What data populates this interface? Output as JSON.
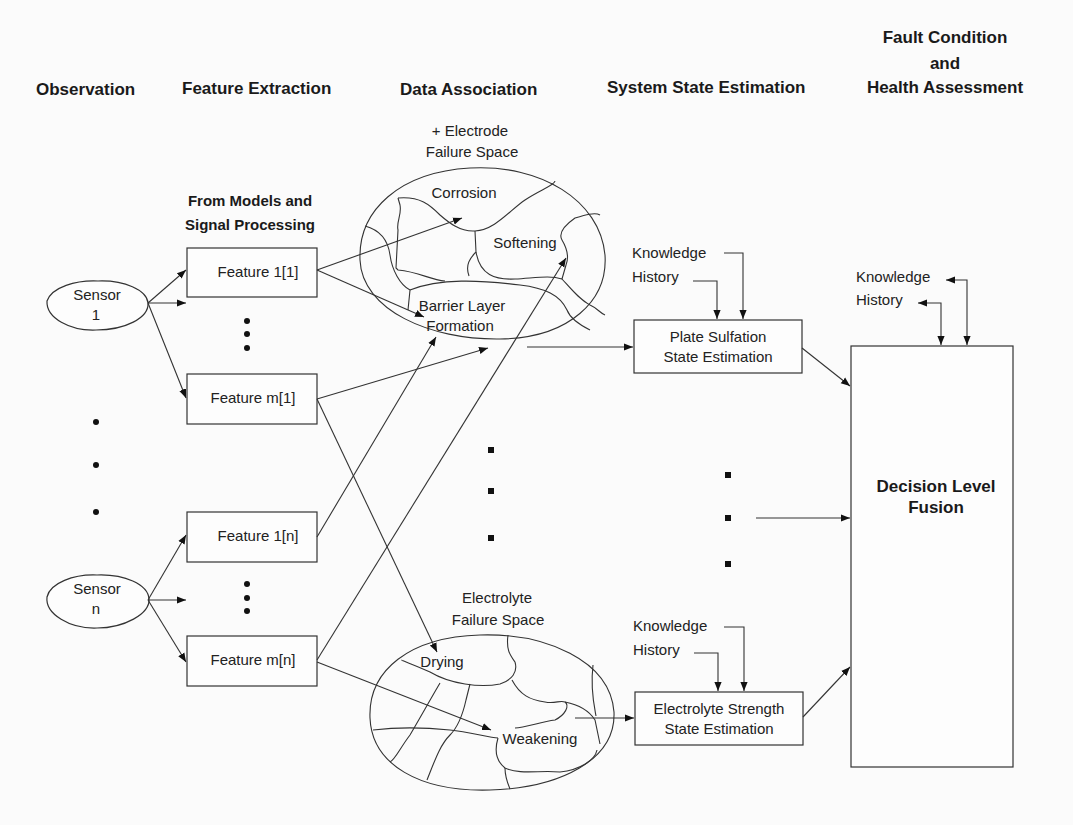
{
  "stages": {
    "observation": "Observation",
    "feature_extraction": "Feature Extraction",
    "data_association": "Data Association",
    "system_state_estimation": "System State Estimation",
    "fault_condition_line1": "Fault Condition",
    "fault_condition_line2": "and",
    "fault_condition_line3": "Health Assessment"
  },
  "feature_source": {
    "line1": "From Models and",
    "line2": "Signal Processing"
  },
  "sensors": [
    {
      "line1": "Sensor",
      "line2": "1"
    },
    {
      "line1": "Sensor",
      "line2": "n"
    }
  ],
  "features": [
    "Feature 1[1]",
    "Feature m[1]",
    "Feature 1[n]",
    "Feature m[n]"
  ],
  "electrode_space": {
    "title_line1": "+ Electrode",
    "title_line2": "Failure Space",
    "regions": [
      "Corrosion",
      "Softening",
      "Barrier Layer",
      "Formation"
    ]
  },
  "electrolyte_space": {
    "title_line1": "Electrolyte",
    "title_line2": "Failure Space",
    "regions": [
      "Drying",
      "Weakening"
    ]
  },
  "estimators": [
    {
      "line1": "Plate Sulfation",
      "line2": "State Estimation",
      "knowledge": "Knowledge",
      "history": "History"
    },
    {
      "line1": "Electrolyte Strength",
      "line2": "State Estimation",
      "knowledge": "Knowledge",
      "history": "History"
    }
  ],
  "fusion": {
    "line1": "Decision Level",
    "line2": "Fusion",
    "knowledge": "Knowledge",
    "history": "History"
  }
}
